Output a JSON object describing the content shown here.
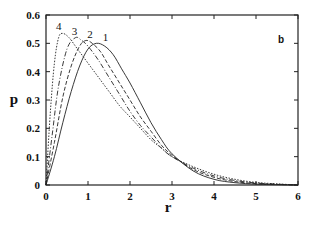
{
  "chart_data": {
    "type": "line",
    "title": "",
    "panel_label": "b",
    "xlabel": "r",
    "ylabel": "p",
    "xlim": [
      0,
      6
    ],
    "ylim": [
      0,
      0.6
    ],
    "xticks": [
      "0",
      "1",
      "2",
      "3",
      "4",
      "5",
      "6"
    ],
    "yticks": [
      "0",
      "0.1",
      "0.2",
      "0.3",
      "0.4",
      "0.5",
      "0.6"
    ],
    "grid": false,
    "legend": "inline curve labels near peaks",
    "series": [
      {
        "name": "1",
        "style": "solid",
        "x": [
          0,
          0.2,
          0.4,
          0.6,
          0.8,
          1.0,
          1.2,
          1.4,
          1.6,
          1.8,
          2.0,
          2.25,
          2.5,
          2.75,
          3.0,
          3.5,
          4.0,
          4.5,
          5.0,
          5.5,
          6.0
        ],
        "y": [
          0,
          0.1,
          0.22,
          0.33,
          0.42,
          0.48,
          0.5,
          0.49,
          0.46,
          0.41,
          0.36,
          0.29,
          0.22,
          0.16,
          0.11,
          0.05,
          0.02,
          0.008,
          0.003,
          0.001,
          0
        ]
      },
      {
        "name": "2",
        "style": "dashed",
        "x": [
          0,
          0.2,
          0.4,
          0.6,
          0.8,
          0.95,
          1.1,
          1.3,
          1.5,
          1.75,
          2.0,
          2.25,
          2.5,
          2.75,
          3.0,
          3.5,
          4.0,
          4.5,
          5.0,
          5.5,
          6.0
        ],
        "y": [
          0,
          0.15,
          0.31,
          0.42,
          0.49,
          0.51,
          0.5,
          0.47,
          0.42,
          0.36,
          0.3,
          0.24,
          0.19,
          0.14,
          0.105,
          0.055,
          0.027,
          0.012,
          0.005,
          0.002,
          0
        ]
      },
      {
        "name": "3",
        "style": "dash-dot",
        "x": [
          0,
          0.15,
          0.3,
          0.5,
          0.7,
          0.85,
          1.0,
          1.25,
          1.5,
          1.75,
          2.0,
          2.25,
          2.5,
          2.75,
          3.0,
          3.5,
          4.0,
          4.5,
          5.0,
          5.5,
          6.0
        ],
        "y": [
          0,
          0.18,
          0.35,
          0.48,
          0.52,
          0.51,
          0.49,
          0.44,
          0.38,
          0.32,
          0.26,
          0.21,
          0.17,
          0.13,
          0.1,
          0.06,
          0.032,
          0.016,
          0.007,
          0.003,
          0
        ]
      },
      {
        "name": "4",
        "style": "dotted",
        "x": [
          0,
          0.1,
          0.2,
          0.3,
          0.4,
          0.55,
          0.75,
          1.0,
          1.25,
          1.5,
          1.75,
          2.0,
          2.25,
          2.5,
          2.75,
          3.0,
          3.5,
          4.0,
          4.5,
          5.0,
          5.5,
          6.0
        ],
        "y": [
          0,
          0.25,
          0.43,
          0.52,
          0.535,
          0.52,
          0.48,
          0.43,
          0.38,
          0.33,
          0.28,
          0.24,
          0.2,
          0.16,
          0.13,
          0.1,
          0.065,
          0.038,
          0.02,
          0.009,
          0.004,
          0
        ]
      }
    ]
  }
}
